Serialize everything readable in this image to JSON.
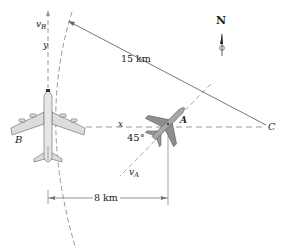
{
  "figure": {
    "compass_label": "N",
    "distance_15_label": "15 km",
    "distance_8_label": "8 km",
    "angle_label": "45°",
    "point_A_label": "A",
    "point_B_label": "B",
    "point_C_label": "C",
    "x_axis_label": "x",
    "y_axis_label": "y",
    "vB_main": "v",
    "vB_sub": "B",
    "vA_main": "v",
    "vA_sub": "A"
  },
  "colors": {
    "line": "#555555",
    "dashed": "#8a8a8a",
    "plane_B_fill": "#d9d9d9",
    "plane_A_fill": "#8c8c8c"
  }
}
